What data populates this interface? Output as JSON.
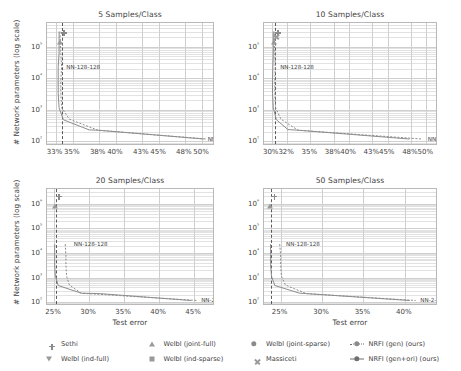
{
  "figure": {
    "ylabel": "# Network parameters (log scale)",
    "xlabel": "Test error"
  },
  "legend": {
    "items": [
      {
        "label": "Sethi",
        "marker": "plus",
        "line": "none"
      },
      {
        "label": "Welbl (joint-full)",
        "marker": "triangle-up",
        "line": "none"
      },
      {
        "label": "Welbl (joint-sparse)",
        "marker": "circle",
        "line": "none"
      },
      {
        "label": "NRFI (gen) (ours)",
        "marker": "circle",
        "line": "dotted"
      },
      {
        "label": "Welbl (ind-full)",
        "marker": "triangle-down",
        "line": "none"
      },
      {
        "label": "Welbl (ind-sparse)",
        "marker": "square",
        "line": "none"
      },
      {
        "label": "Massiceti",
        "marker": "x",
        "line": "none"
      },
      {
        "label": "NRFI (gen+ori) (ours)",
        "marker": "circle",
        "line": "solid"
      }
    ]
  },
  "chart_data": [
    {
      "id": "panel-5",
      "type": "scatter",
      "title": "5 Samples/Class",
      "xlabel": "Test error",
      "ylabel": "# Network parameters (log scale)",
      "xlim": [
        32.0,
        51.5
      ],
      "ylim_log10": [
        1.85,
        5.75
      ],
      "yticks": [
        100,
        1000,
        10000,
        100000
      ],
      "ytick_labels": [
        "10²",
        "10³",
        "10⁴",
        "10⁵"
      ],
      "xticks": [
        33,
        35,
        38,
        40,
        43,
        45,
        48,
        50
      ],
      "xtick_labels": [
        "33%",
        "35%",
        "38%",
        "40%",
        "43%",
        "45%",
        "48%",
        "50%"
      ],
      "vline_x": 33.7,
      "grid": true,
      "annotations": [
        {
          "text": "NN-128-128",
          "x": 33.9,
          "y": 23000
        },
        {
          "text": "NN-2-2",
          "x": 50.3,
          "y": 120
        }
      ],
      "series": [
        {
          "name": "NRFI (gen+ori) (ours)",
          "line": "solid",
          "marker": "circle",
          "points": [
            {
              "x": 33.4,
              "y": 300000
            },
            {
              "x": 33.4,
              "y": 62000
            },
            {
              "x": 33.3,
              "y": 23000
            },
            {
              "x": 33.3,
              "y": 8500
            },
            {
              "x": 33.3,
              "y": 3300
            },
            {
              "x": 33.4,
              "y": 1150
            },
            {
              "x": 33.9,
              "y": 480
            },
            {
              "x": 36.9,
              "y": 230
            },
            {
              "x": 37.9,
              "y": 225
            },
            {
              "x": 50.2,
              "y": 118
            }
          ]
        },
        {
          "name": "NRFI (gen) (ours)",
          "line": "dotted",
          "marker": "circle",
          "points": [
            {
              "x": 33.5,
              "y": 300000
            },
            {
              "x": 33.6,
              "y": 62000
            },
            {
              "x": 33.7,
              "y": 23000
            },
            {
              "x": 33.6,
              "y": 8500
            },
            {
              "x": 33.6,
              "y": 3300
            },
            {
              "x": 33.7,
              "y": 1150
            },
            {
              "x": 34.6,
              "y": 500
            },
            {
              "x": 37.9,
              "y": 225
            },
            {
              "x": 50.5,
              "y": 118
            }
          ]
        },
        {
          "name": "Sethi",
          "line": "none",
          "marker": "plus",
          "points": [
            {
              "x": 33.65,
              "y": 330000
            }
          ]
        },
        {
          "name": "Welbl (joint-full)",
          "line": "none",
          "marker": "triangle-up",
          "points": [
            {
              "x": 33.55,
              "y": 330000
            }
          ]
        }
      ]
    },
    {
      "id": "panel-10",
      "type": "scatter",
      "title": "10 Samples/Class",
      "xlabel": "Test error",
      "ylabel": "# Network parameters (log scale)",
      "xlim": [
        29.0,
        51.5
      ],
      "ylim_log10": [
        1.85,
        5.75
      ],
      "yticks": [
        100,
        1000,
        10000,
        100000
      ],
      "ytick_labels": [
        "10²",
        "10³",
        "10⁴",
        "10⁵"
      ],
      "xticks": [
        30,
        32,
        35,
        38,
        40,
        43,
        45,
        48,
        50
      ],
      "xtick_labels": [
        "30%",
        "32%",
        "35%",
        "38%",
        "40%",
        "43%",
        "45%",
        "48%",
        "50%"
      ],
      "vline_x": 30.4,
      "grid": true,
      "annotations": [
        {
          "text": "NN-128-128",
          "x": 30.7,
          "y": 23000
        },
        {
          "text": "NN-2-2",
          "x": 49.8,
          "y": 120
        }
      ],
      "series": [
        {
          "name": "NRFI (gen+ori) (ours)",
          "line": "solid",
          "marker": "circle",
          "points": [
            {
              "x": 30.2,
              "y": 300000
            },
            {
              "x": 30.2,
              "y": 62000
            },
            {
              "x": 30.15,
              "y": 23000
            },
            {
              "x": 30.1,
              "y": 8500
            },
            {
              "x": 30.1,
              "y": 3300
            },
            {
              "x": 30.2,
              "y": 1150
            },
            {
              "x": 30.6,
              "y": 480
            },
            {
              "x": 32.1,
              "y": 235
            },
            {
              "x": 33.4,
              "y": 225
            },
            {
              "x": 47.8,
              "y": 118
            }
          ]
        },
        {
          "name": "NRFI (gen) (ours)",
          "line": "dotted",
          "marker": "circle",
          "points": [
            {
              "x": 30.3,
              "y": 300000
            },
            {
              "x": 30.4,
              "y": 62000
            },
            {
              "x": 30.45,
              "y": 23000
            },
            {
              "x": 30.4,
              "y": 8500
            },
            {
              "x": 30.4,
              "y": 3300
            },
            {
              "x": 30.5,
              "y": 1150
            },
            {
              "x": 31.2,
              "y": 500
            },
            {
              "x": 33.4,
              "y": 225
            },
            {
              "x": 49.4,
              "y": 118
            }
          ]
        },
        {
          "name": "Sethi",
          "line": "none",
          "marker": "plus",
          "points": [
            {
              "x": 30.45,
              "y": 330000
            }
          ]
        },
        {
          "name": "Welbl (joint-full)",
          "line": "none",
          "marker": "triangle-up",
          "points": [
            {
              "x": 30.3,
              "y": 330000
            }
          ]
        },
        {
          "name": "Massiceti",
          "line": "none",
          "marker": "x",
          "points": [
            {
              "x": 30.2,
              "y": 250000
            }
          ]
        }
      ]
    },
    {
      "id": "panel-20",
      "type": "scatter",
      "title": "20 Samples/Class",
      "xlabel": "Test error",
      "ylabel": "# Network parameters (log scale)",
      "xlim": [
        24.0,
        48.0
      ],
      "ylim_log10": [
        1.85,
        6.6
      ],
      "yticks": [
        100,
        1000,
        10000,
        100000,
        1000000
      ],
      "ytick_labels": [
        "10²",
        "10³",
        "10⁴",
        "10⁵",
        "10⁶"
      ],
      "xticks": [
        25,
        30,
        35,
        40,
        45
      ],
      "xtick_labels": [
        "25%",
        "30%",
        "35%",
        "40%",
        "45%"
      ],
      "vline_x": 25.3,
      "grid": true,
      "annotations": [
        {
          "text": "NN-128-128",
          "x": 27.4,
          "y": 23000
        },
        {
          "text": "NN-2-2",
          "x": 45.6,
          "y": 120
        }
      ],
      "series": [
        {
          "name": "NRFI (gen+ori) (ours)",
          "line": "solid",
          "marker": "circle",
          "points": [
            {
              "x": 25.1,
              "y": 23000
            },
            {
              "x": 25.1,
              "y": 8500
            },
            {
              "x": 25.1,
              "y": 3300
            },
            {
              "x": 25.2,
              "y": 1150
            },
            {
              "x": 25.6,
              "y": 480
            },
            {
              "x": 28.9,
              "y": 235
            },
            {
              "x": 31.5,
              "y": 225
            },
            {
              "x": 44.6,
              "y": 118
            }
          ]
        },
        {
          "name": "NRFI (gen) (ours)",
          "line": "dotted",
          "marker": "circle",
          "points": [
            {
              "x": 26.6,
              "y": 23000
            },
            {
              "x": 26.7,
              "y": 8500
            },
            {
              "x": 26.7,
              "y": 3300
            },
            {
              "x": 26.8,
              "y": 1150
            },
            {
              "x": 27.2,
              "y": 500
            },
            {
              "x": 28.9,
              "y": 235
            },
            {
              "x": 45.5,
              "y": 118
            }
          ]
        },
        {
          "name": "Sethi",
          "line": "none",
          "marker": "plus",
          "points": [
            {
              "x": 25.3,
              "y": 2600000
            }
          ]
        },
        {
          "name": "Welbl (joint-full)",
          "line": "none",
          "marker": "triangle-up",
          "points": [
            {
              "x": 25.15,
              "y": 2600000
            }
          ]
        },
        {
          "name": "Welbl (ind-sparse)",
          "line": "none",
          "marker": "square",
          "points": [
            {
              "x": 25.2,
              "y": 330000
            }
          ]
        }
      ]
    },
    {
      "id": "panel-50",
      "type": "scatter",
      "title": "50 Samples/Class",
      "xlabel": "Test error",
      "ylabel": "# Network parameters (log scale)",
      "xlim": [
        23.0,
        44.0
      ],
      "ylim_log10": [
        1.85,
        6.6
      ],
      "yticks": [
        100,
        1000,
        10000,
        100000,
        1000000
      ],
      "ytick_labels": [
        "10²",
        "10³",
        "10⁴",
        "10⁵",
        "10⁶"
      ],
      "xticks": [
        25,
        30,
        35,
        40
      ],
      "xtick_labels": [
        "25%",
        "30%",
        "35%",
        "40%"
      ],
      "vline_x": 23.9,
      "grid": true,
      "annotations": [
        {
          "text": "NN-128-128",
          "x": 25.3,
          "y": 23000
        },
        {
          "text": "NN-2-2",
          "x": 41.5,
          "y": 120
        }
      ],
      "series": [
        {
          "name": "NRFI (gen+ori) (ours)",
          "line": "solid",
          "marker": "circle",
          "points": [
            {
              "x": 23.8,
              "y": 23000
            },
            {
              "x": 23.8,
              "y": 8500
            },
            {
              "x": 23.8,
              "y": 3300
            },
            {
              "x": 23.9,
              "y": 1150
            },
            {
              "x": 24.3,
              "y": 480
            },
            {
              "x": 27.3,
              "y": 235
            },
            {
              "x": 28.1,
              "y": 225
            },
            {
              "x": 40.6,
              "y": 118
            }
          ]
        },
        {
          "name": "NRFI (gen) (ours)",
          "line": "dotted",
          "marker": "circle",
          "points": [
            {
              "x": 24.9,
              "y": 23000
            },
            {
              "x": 25.0,
              "y": 8500
            },
            {
              "x": 25.0,
              "y": 3300
            },
            {
              "x": 25.1,
              "y": 1150
            },
            {
              "x": 25.6,
              "y": 500
            },
            {
              "x": 28.1,
              "y": 225
            },
            {
              "x": 41.3,
              "y": 118
            }
          ]
        },
        {
          "name": "Sethi",
          "line": "none",
          "marker": "plus",
          "points": [
            {
              "x": 23.9,
              "y": 2600000
            }
          ]
        },
        {
          "name": "Welbl (joint-full)",
          "line": "none",
          "marker": "triangle-up",
          "points": [
            {
              "x": 23.75,
              "y": 2600000
            }
          ]
        },
        {
          "name": "Welbl (ind-sparse)",
          "line": "none",
          "marker": "square",
          "points": [
            {
              "x": 23.85,
              "y": 330000
            }
          ]
        }
      ]
    }
  ]
}
